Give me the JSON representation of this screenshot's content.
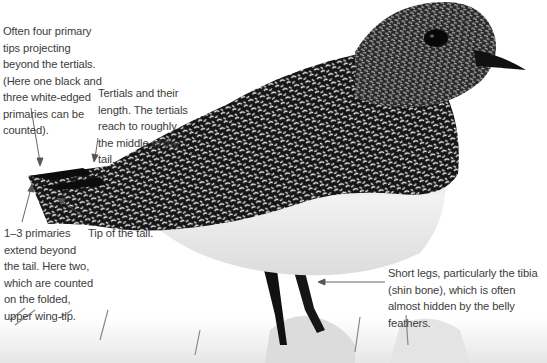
{
  "figure": {
    "colors": {
      "background": "#ffffff",
      "text": "#3c3c3c",
      "leader_line": "#555555",
      "plumage_dark": "#111111",
      "plumage_light": "#e9e9e9"
    }
  },
  "annotations": [
    {
      "id": "primaries-projection",
      "text": "Often four primary tips projecting beyond the tertials. (Here one black and three white-edged primaries can be counted)."
    },
    {
      "id": "tertials",
      "text": "Tertials and their length. The tertials reach to roughly the middle of the tail."
    },
    {
      "id": "primaries-beyond-tail",
      "text": "1–3 primaries extend beyond the tail. Here two, which are counted on the folded, upper wing-tip."
    },
    {
      "id": "tail-tip",
      "text": "Tip of the tail."
    },
    {
      "id": "short-legs",
      "text": "Short legs, particularly the tibia (shin bone), which is often almost hidden by the belly feathers."
    }
  ]
}
